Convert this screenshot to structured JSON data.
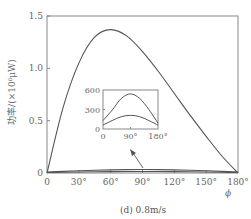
{
  "chart_data": {
    "type": "line",
    "title": "",
    "caption": "(d) 0.8m/s",
    "xlabel": "ϕ",
    "ylabel": "功率/(×10⁶μW)",
    "xlim": [
      0,
      180
    ],
    "ylim": [
      0,
      1.5
    ],
    "xticks": [
      "0",
      "30°",
      "60°",
      "90°",
      "120°",
      "150°",
      "180°"
    ],
    "yticks": [
      "0",
      "0.5",
      "1.0",
      "1.5"
    ],
    "grid": false,
    "legend": null,
    "x": [
      0,
      15,
      30,
      45,
      60,
      75,
      90,
      105,
      120,
      135,
      150,
      165,
      180
    ],
    "series": [
      {
        "name": "main",
        "values": [
          0.0,
          0.62,
          1.05,
          1.3,
          1.37,
          1.31,
          1.16,
          0.97,
          0.76,
          0.55,
          0.35,
          0.16,
          0.0
        ]
      },
      {
        "name": "low-1",
        "values": [
          0.0001,
          0.0002,
          0.0003,
          0.0004,
          0.0005,
          0.00053,
          0.00054,
          0.00053,
          0.0005,
          0.0004,
          0.0003,
          0.0002,
          0.0001
        ]
      },
      {
        "name": "low-2",
        "values": [
          6e-05,
          0.0001,
          0.00014,
          0.00018,
          0.0002,
          0.00021,
          0.00021,
          0.00021,
          0.0002,
          0.00017,
          0.00013,
          9e-05,
          6e-05
        ]
      }
    ],
    "inset": {
      "type": "line",
      "xlim": [
        0,
        180
      ],
      "ylim": [
        0,
        600
      ],
      "xticks": [
        "0",
        "90°",
        "180°"
      ],
      "yticks": [
        "0",
        "300",
        "600"
      ],
      "x": [
        0,
        30,
        60,
        90,
        120,
        150,
        180
      ],
      "series": [
        {
          "name": "upper",
          "values": [
            130,
            290,
            470,
            540,
            470,
            300,
            90
          ]
        },
        {
          "name": "lower",
          "values": [
            60,
            130,
            190,
            210,
            190,
            130,
            60
          ]
        }
      ],
      "annotation": "arrow pointing from the near-zero curves at ~90° to the inset"
    }
  }
}
